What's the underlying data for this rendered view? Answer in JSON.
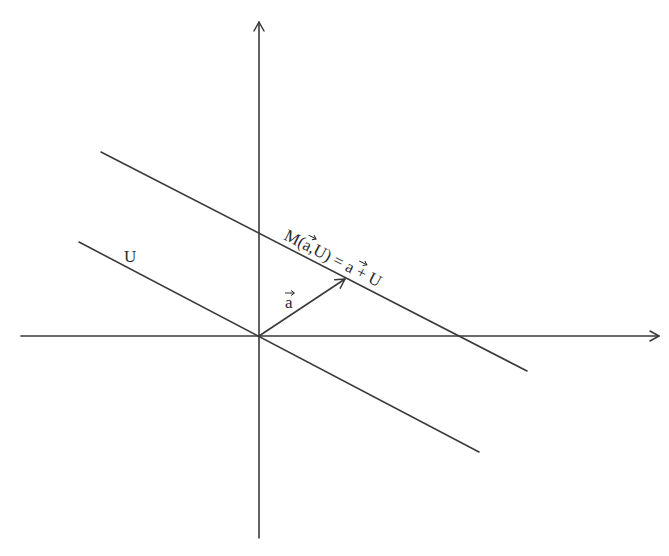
{
  "diagram": {
    "type": "vector-geometry",
    "colors": {
      "stroke": "#3a3a3a",
      "text": "#2a2a2a",
      "background": "#ffffff"
    },
    "axes": {
      "origin": [
        259,
        336
      ],
      "x_axis": {
        "from": [
          21,
          336
        ],
        "to": [
          659,
          336
        ],
        "arrow": true
      },
      "y_axis": {
        "from": [
          259,
          538
        ],
        "to": [
          259,
          22
        ],
        "arrow": true
      }
    },
    "lines": [
      {
        "id": "U",
        "from": [
          79,
          242
        ],
        "to": [
          479,
          452
        ]
      },
      {
        "id": "M",
        "from": [
          101,
          152
        ],
        "to": [
          527,
          371
        ]
      }
    ],
    "vector_a": {
      "from": [
        259,
        336
      ],
      "to": [
        345,
        279
      ]
    },
    "labels": {
      "U": {
        "text": "U",
        "x": 124,
        "y": 262
      },
      "a": {
        "base": "a",
        "x": 285,
        "y": 308
      },
      "M": {
        "prefix": "M(",
        "a": "a",
        "mid": ",U) = ",
        "a2": "a",
        "suffix": " + U",
        "x": 283,
        "y": 239,
        "rotate": 27
      }
    }
  }
}
